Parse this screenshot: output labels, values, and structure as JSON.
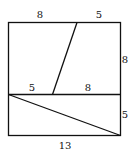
{
  "diagram": {
    "labels": {
      "top_left": "8",
      "top_right": "5",
      "right_upper": "8",
      "middle_left": "5",
      "middle_right": "8",
      "right_lower": "5",
      "bottom": "13"
    },
    "colors": {
      "stroke": "#111111",
      "background": "#ffffff"
    }
  }
}
